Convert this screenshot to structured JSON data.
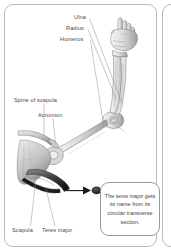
{
  "figure": {
    "background_color": "#ffffff",
    "border_color": "#b9b9b9",
    "ink_color": "#555555",
    "label_color": "#4a4a4a"
  },
  "labels": {
    "ulna": "Ulna",
    "radius": "Radius",
    "humerus": "Humerus",
    "spine_of_scapula": "Spine of scapula",
    "acromion": "Acromion",
    "scapula": "Scapula",
    "teres_major": "Teres major"
  },
  "callout": {
    "text": "The teres major gets its name from its circular transverse section.",
    "border_color": "#9a9a9a"
  },
  "annotation": {
    "arrow_name": "transverse-section-arrow",
    "section_marker_name": "circular-transverse-section",
    "section_marker_color": "#2e2e2e"
  },
  "illustration": {
    "subject": "right upper limb skeleton with shoulder girdle",
    "parts": [
      "clenched fist",
      "forearm bones",
      "elbow joint",
      "humerus shaft",
      "scapula",
      "shaded teres major muscle"
    ]
  }
}
